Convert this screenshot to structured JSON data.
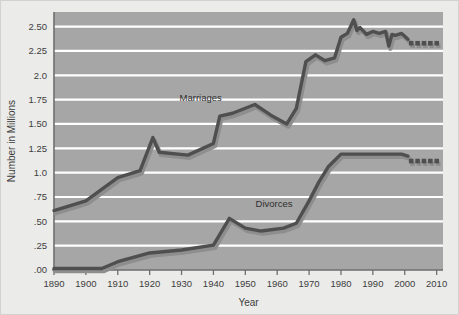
{
  "chart_data": {
    "type": "line",
    "title": "",
    "xlabel": "Year",
    "ylabel": "Number in Millions",
    "xlim": [
      1890,
      2012
    ],
    "ylim": [
      0,
      2.65
    ],
    "grid": true,
    "legend_position": "inline-annotation",
    "xticks": [
      1890,
      1900,
      1910,
      1920,
      1930,
      1940,
      1950,
      1960,
      1970,
      1980,
      1990,
      2000,
      2010
    ],
    "xticklabels": [
      "1890",
      "1900",
      "1910",
      "1920",
      "1930",
      "1940",
      "1950",
      "1960",
      "1970",
      "1980",
      "1990",
      "2000",
      "2010"
    ],
    "yticks": [
      0,
      0.25,
      0.5,
      0.75,
      1.0,
      1.25,
      1.5,
      1.75,
      2.0,
      2.25,
      2.5
    ],
    "yticklabels": [
      ".00",
      ".25",
      ".50",
      ".75",
      "1.0",
      "1.25",
      "1.50",
      "1.75",
      "2.0",
      "2.25",
      "2.50"
    ],
    "series": [
      {
        "name": "Marriages",
        "color": "#4f4f4f",
        "shadow_color": "#8e8e8e",
        "label_x": 1936,
        "label_y": 1.74,
        "solid": {
          "x": [
            1890,
            1900,
            1910,
            1917,
            1921,
            1923,
            1932,
            1940,
            1942,
            1946,
            1953,
            1958,
            1963,
            1966,
            1969,
            1972,
            1975,
            1978,
            1980,
            1982,
            1984,
            1985,
            1986,
            1988,
            1990,
            1992,
            1994,
            1995,
            1996,
            1997,
            1999,
            2000,
            2001
          ],
          "y": [
            0.61,
            0.71,
            0.95,
            1.02,
            1.36,
            1.21,
            1.18,
            1.3,
            1.58,
            1.61,
            1.7,
            1.59,
            1.5,
            1.66,
            2.14,
            2.21,
            2.15,
            2.18,
            2.39,
            2.43,
            2.57,
            2.46,
            2.49,
            2.42,
            2.45,
            2.43,
            2.45,
            2.3,
            2.42,
            2.41,
            2.43,
            2.4,
            2.37
          ]
        },
        "projected": {
          "x": [
            2002,
            2004,
            2006,
            2008,
            2010
          ],
          "y": [
            2.33,
            2.33,
            2.33,
            2.33,
            2.33
          ]
        }
      },
      {
        "name": "Divorces",
        "color": "#4f4f4f",
        "shadow_color": "#8e8e8e",
        "label_x": 1959,
        "label_y": 0.645,
        "solid": {
          "x": [
            1890,
            1905,
            1910,
            1920,
            1930,
            1940,
            1945,
            1950,
            1955,
            1962,
            1966,
            1970,
            1973,
            1976,
            1980,
            1985,
            1990,
            1995,
            1999,
            2001
          ],
          "y": [
            0.015,
            0.015,
            0.085,
            0.175,
            0.205,
            0.255,
            0.53,
            0.43,
            0.4,
            0.43,
            0.48,
            0.71,
            0.9,
            1.06,
            1.19,
            1.19,
            1.19,
            1.19,
            1.19,
            1.17
          ]
        },
        "projected": {
          "x": [
            2002,
            2004,
            2006,
            2008,
            2010
          ],
          "y": [
            1.12,
            1.12,
            1.12,
            1.12,
            1.12
          ]
        }
      }
    ],
    "colors": {
      "plot_background": "#a6a6a6",
      "figure_background": "#ebebe9",
      "gridline": "#ffffff",
      "line": "#4f4f4f",
      "line_shadow": "#8e8e8e",
      "axis": "#6e6e6e",
      "text": "#3d3d3d"
    }
  }
}
